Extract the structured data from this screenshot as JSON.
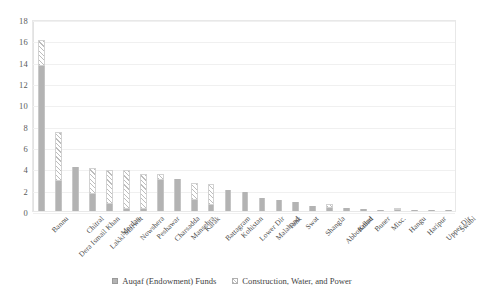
{
  "chart_data": {
    "type": "bar",
    "subtype": "stacked-column",
    "title": "",
    "subtitle": "",
    "xlabel": "",
    "ylabel": "",
    "ylim": [
      0,
      18
    ],
    "ytick_step": 2,
    "yticks": [
      "0",
      "2",
      "4",
      "6",
      "8",
      "10",
      "12",
      "14",
      "16",
      "18"
    ],
    "grid": true,
    "grid_orientation": "horizontal",
    "legend_position": "bottom-center",
    "categories": [
      "Bannu",
      "Dera Ismail Khan",
      "Chitral",
      "Lakki Marwat",
      "Mardan",
      "Nowshera",
      "Peshawar",
      "Charsadda",
      "Mansehra",
      "Karak",
      "Battagram",
      "Kohistan",
      "Lower Dir",
      "Malakand",
      "Tank",
      "Swat",
      "Shangla",
      "Abbottabad",
      "Kohat",
      "Buner",
      "Misc.",
      "Hangu",
      "Haripur",
      "Upper Dir",
      "Swabi"
    ],
    "series": [
      {
        "name": "Auqaf (Endowment) Funds",
        "color": "#b3b3b3",
        "pattern": "solid",
        "values": [
          13.6,
          2.8,
          4.1,
          1.6,
          0.7,
          0.2,
          0.2,
          2.9,
          3.0,
          1.0,
          0.6,
          2.0,
          1.8,
          1.2,
          1.0,
          0.8,
          0.5,
          0.3,
          0.25,
          0.15,
          0.1,
          0.05,
          0.05,
          0.05,
          0.05
        ]
      },
      {
        "name": "Construction, Water, and Power",
        "color": "#ffffff",
        "pattern": "diagonal-hatch",
        "values": [
          2.4,
          4.6,
          0.0,
          2.4,
          3.1,
          3.6,
          3.3,
          0.6,
          0.0,
          1.6,
          1.9,
          0.0,
          0.0,
          0.0,
          0.0,
          0.0,
          0.0,
          0.35,
          0.0,
          0.0,
          0.0,
          0.1,
          0.0,
          0.0,
          0.0
        ]
      }
    ],
    "totals": [
      16.0,
      7.4,
      4.1,
      4.0,
      3.8,
      3.8,
      3.5,
      3.5,
      3.0,
      2.6,
      2.5,
      2.0,
      1.8,
      1.2,
      1.0,
      0.8,
      0.5,
      0.65,
      0.25,
      0.15,
      0.1,
      0.15,
      0.05,
      0.05,
      0.05
    ]
  },
  "legend": {
    "items": [
      {
        "label": "Auqaf (Endowment) Funds"
      },
      {
        "label": "Construction, Water, and Power"
      }
    ]
  }
}
